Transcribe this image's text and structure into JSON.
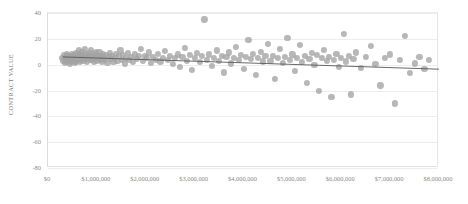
{
  "chart_data": {
    "type": "scatter",
    "title": "",
    "subtitle": "",
    "xlabel": "",
    "ylabel": "CONTRACT VALUE",
    "grid": true,
    "legend": "none",
    "xlim": [
      0,
      8000000
    ],
    "ylim": [
      -80,
      40
    ],
    "xticks": [
      0,
      1000000,
      2000000,
      3000000,
      4000000,
      5000000,
      6000000,
      7000000,
      8000000
    ],
    "xticklabels": [
      "$0",
      "$1,000,000",
      "$2,000,000",
      "$3,000,000",
      "$4,000,000",
      "$5,000,000",
      "$6,000,000",
      "$7,000,000",
      "$8,000,000"
    ],
    "yticks": [
      40,
      20,
      0,
      -20,
      -40,
      -60,
      -80
    ],
    "yticklabels": [
      "40",
      "20",
      "0",
      "-20",
      "-40",
      "-60",
      "-80"
    ],
    "marker": {
      "shape": "circle",
      "color": "#a3a3a3",
      "size_px": 6.2,
      "opacity": 0.78
    },
    "trendline": {
      "visible": true,
      "color": "#595959",
      "width_px": 0.9,
      "x0": 300000,
      "y0": 6.0,
      "x1": 8000000,
      "y1": -3.5
    },
    "points": [
      [
        290000,
        5.5
      ],
      [
        310000,
        3.0
      ],
      [
        330000,
        7.5
      ],
      [
        345000,
        1.5
      ],
      [
        360000,
        6.0
      ],
      [
        370000,
        4.0
      ],
      [
        385000,
        8.0
      ],
      [
        395000,
        2.5
      ],
      [
        405000,
        5.0
      ],
      [
        415000,
        6.5
      ],
      [
        425000,
        3.5
      ],
      [
        435000,
        7.0
      ],
      [
        445000,
        1.0
      ],
      [
        455000,
        4.5
      ],
      [
        465000,
        6.0
      ],
      [
        475000,
        2.0
      ],
      [
        485000,
        8.5
      ],
      [
        495000,
        5.5
      ],
      [
        505000,
        3.0
      ],
      [
        515000,
        6.5
      ],
      [
        525000,
        4.0
      ],
      [
        535000,
        7.5
      ],
      [
        545000,
        1.5
      ],
      [
        555000,
        5.0
      ],
      [
        565000,
        9.0
      ],
      [
        575000,
        2.5
      ],
      [
        585000,
        6.0
      ],
      [
        595000,
        4.5
      ],
      [
        605000,
        7.0
      ],
      [
        615000,
        3.5
      ],
      [
        625000,
        11.0
      ],
      [
        635000,
        5.5
      ],
      [
        645000,
        8.0
      ],
      [
        655000,
        2.0
      ],
      [
        665000,
        6.5
      ],
      [
        675000,
        4.0
      ],
      [
        690000,
        9.5
      ],
      [
        700000,
        5.0
      ],
      [
        715000,
        7.5
      ],
      [
        725000,
        3.0
      ],
      [
        740000,
        6.0
      ],
      [
        755000,
        12.0
      ],
      [
        765000,
        4.5
      ],
      [
        780000,
        8.5
      ],
      [
        795000,
        2.5
      ],
      [
        810000,
        6.5
      ],
      [
        825000,
        5.0
      ],
      [
        840000,
        9.0
      ],
      [
        855000,
        3.5
      ],
      [
        870000,
        7.0
      ],
      [
        885000,
        11.5
      ],
      [
        900000,
        4.0
      ],
      [
        915000,
        6.0
      ],
      [
        930000,
        8.0
      ],
      [
        945000,
        2.0
      ],
      [
        960000,
        5.5
      ],
      [
        980000,
        9.5
      ],
      [
        995000,
        3.0
      ],
      [
        1010000,
        7.0
      ],
      [
        1030000,
        5.0
      ],
      [
        1050000,
        10.0
      ],
      [
        1070000,
        4.0
      ],
      [
        1090000,
        6.5
      ],
      [
        1110000,
        2.5
      ],
      [
        1130000,
        8.0
      ],
      [
        1150000,
        5.5
      ],
      [
        1170000,
        3.5
      ],
      [
        1190000,
        7.5
      ],
      [
        1215000,
        1.5
      ],
      [
        1240000,
        6.0
      ],
      [
        1265000,
        9.0
      ],
      [
        1290000,
        4.5
      ],
      [
        1315000,
        7.0
      ],
      [
        1340000,
        2.0
      ],
      [
        1365000,
        5.0
      ],
      [
        1390000,
        8.5
      ],
      [
        1420000,
        3.0
      ],
      [
        1450000,
        6.5
      ],
      [
        1480000,
        11.0
      ],
      [
        1510000,
        4.0
      ],
      [
        1540000,
        7.5
      ],
      [
        1570000,
        1.0
      ],
      [
        1600000,
        5.5
      ],
      [
        1630000,
        9.0
      ],
      [
        1660000,
        3.5
      ],
      [
        1700000,
        6.0
      ],
      [
        1740000,
        2.0
      ],
      [
        1780000,
        8.0
      ],
      [
        1820000,
        4.5
      ],
      [
        1860000,
        6.5
      ],
      [
        1900000,
        12.5
      ],
      [
        1940000,
        3.0
      ],
      [
        1980000,
        7.0
      ],
      [
        2020000,
        5.0
      ],
      [
        2060000,
        9.5
      ],
      [
        2100000,
        1.5
      ],
      [
        2150000,
        6.0
      ],
      [
        2200000,
        4.0
      ],
      [
        2250000,
        8.5
      ],
      [
        2300000,
        2.5
      ],
      [
        2350000,
        5.5
      ],
      [
        2400000,
        10.5
      ],
      [
        2450000,
        3.5
      ],
      [
        2500000,
        7.0
      ],
      [
        2550000,
        0.5
      ],
      [
        2600000,
        5.0
      ],
      [
        2650000,
        8.0
      ],
      [
        2700000,
        -2.0
      ],
      [
        2750000,
        6.0
      ],
      [
        2800000,
        13.0
      ],
      [
        2850000,
        3.0
      ],
      [
        2900000,
        7.5
      ],
      [
        2950000,
        -4.0
      ],
      [
        3000000,
        5.5
      ],
      [
        3050000,
        9.0
      ],
      [
        3100000,
        2.0
      ],
      [
        3150000,
        6.5
      ],
      [
        3200000,
        35.0
      ],
      [
        3250000,
        4.0
      ],
      [
        3300000,
        8.0
      ],
      [
        3350000,
        -1.0
      ],
      [
        3400000,
        5.0
      ],
      [
        3450000,
        11.0
      ],
      [
        3500000,
        3.0
      ],
      [
        3550000,
        7.0
      ],
      [
        3600000,
        -6.0
      ],
      [
        3650000,
        6.0
      ],
      [
        3700000,
        9.5
      ],
      [
        3750000,
        1.0
      ],
      [
        3800000,
        5.5
      ],
      [
        3850000,
        14.0
      ],
      [
        3900000,
        3.5
      ],
      [
        3950000,
        7.5
      ],
      [
        4000000,
        -3.0
      ],
      [
        4050000,
        6.0
      ],
      [
        4100000,
        19.0
      ],
      [
        4150000,
        4.5
      ],
      [
        4200000,
        8.5
      ],
      [
        4250000,
        -8.0
      ],
      [
        4300000,
        5.0
      ],
      [
        4350000,
        10.0
      ],
      [
        4400000,
        2.5
      ],
      [
        4450000,
        6.5
      ],
      [
        4500000,
        16.0
      ],
      [
        4550000,
        3.0
      ],
      [
        4600000,
        7.0
      ],
      [
        4650000,
        -11.0
      ],
      [
        4700000,
        5.5
      ],
      [
        4750000,
        12.0
      ],
      [
        4800000,
        1.5
      ],
      [
        4850000,
        6.0
      ],
      [
        4900000,
        21.0
      ],
      [
        4950000,
        4.0
      ],
      [
        5000000,
        8.0
      ],
      [
        5050000,
        -5.0
      ],
      [
        5100000,
        5.0
      ],
      [
        5150000,
        15.0
      ],
      [
        5200000,
        2.0
      ],
      [
        5250000,
        6.5
      ],
      [
        5300000,
        -14.0
      ],
      [
        5350000,
        4.5
      ],
      [
        5400000,
        9.0
      ],
      [
        5450000,
        0.0
      ],
      [
        5500000,
        7.5
      ],
      [
        5550000,
        -20.0
      ],
      [
        5600000,
        5.0
      ],
      [
        5650000,
        11.5
      ],
      [
        5700000,
        3.0
      ],
      [
        5750000,
        6.0
      ],
      [
        5800000,
        -25.0
      ],
      [
        5850000,
        4.0
      ],
      [
        5900000,
        8.5
      ],
      [
        5950000,
        -1.5
      ],
      [
        6000000,
        5.5
      ],
      [
        6050000,
        24.0
      ],
      [
        6100000,
        2.5
      ],
      [
        6150000,
        7.0
      ],
      [
        6200000,
        -23.0
      ],
      [
        6250000,
        4.5
      ],
      [
        6300000,
        9.5
      ],
      [
        6400000,
        -2.5
      ],
      [
        6500000,
        6.0
      ],
      [
        6600000,
        14.5
      ],
      [
        6700000,
        0.5
      ],
      [
        6800000,
        -16.0
      ],
      [
        6900000,
        5.0
      ],
      [
        7000000,
        8.0
      ],
      [
        7100000,
        -30.0
      ],
      [
        7200000,
        3.5
      ],
      [
        7300000,
        22.0
      ],
      [
        7400000,
        -6.5
      ],
      [
        7500000,
        1.0
      ],
      [
        7600000,
        6.0
      ],
      [
        7700000,
        -3.0
      ],
      [
        7800000,
        4.0
      ]
    ]
  },
  "axes": {
    "y_title": "CONTRACT VALUE"
  }
}
